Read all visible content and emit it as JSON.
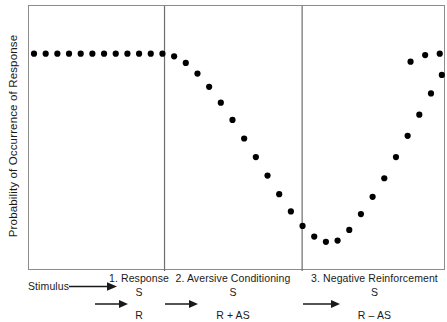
{
  "figure": {
    "y_axis_label": "Probability of Occurrence of Response",
    "stimulus_label": "Stimulus",
    "panels": [
      {
        "title": "1. Response",
        "formula_left": "S",
        "formula_right": "R",
        "arrow_icon": "right-arrow-icon"
      },
      {
        "title": "2. Aversive Conditioning",
        "formula_left": "S",
        "formula_right": "R + AS",
        "arrow_icon": "right-arrow-icon"
      },
      {
        "title": "3. Negative Reinforcement",
        "formula_left": "S",
        "formula_right": "R – AS",
        "arrow_icon": "right-arrow-icon"
      }
    ],
    "colors": {
      "marker": "#000000",
      "frame": "#8c8c8c",
      "divider": "#6e6e6e",
      "text": "#1a1a1a",
      "background": "#ffffff"
    }
  },
  "chart_data": {
    "type": "scatter",
    "title": "",
    "xlabel": "",
    "ylabel": "Probability of Occurrence of Response",
    "grid": false,
    "legend": "none",
    "axis_ticks": false,
    "xlim": [
      0,
      100
    ],
    "ylim": [
      0,
      100
    ],
    "phase_boundaries": [
      32.5,
      65.5
    ],
    "phase_labels": [
      "1. Response",
      "2. Aversive Conditioning",
      "3. Negative Reinforcement"
    ],
    "series": [
      {
        "name": "Probability of response",
        "marker": "filled-circle",
        "x": [
          1.2,
          4.0,
          6.8,
          9.6,
          12.4,
          15.2,
          18.0,
          20.8,
          23.6,
          26.4,
          29.2,
          32.0,
          34.8,
          37.6,
          40.4,
          43.2,
          46.0,
          48.8,
          51.6,
          54.4,
          57.2,
          60.0,
          62.8,
          65.6,
          68.4,
          71.2,
          74.0,
          76.8,
          79.6,
          82.4,
          85.2,
          88.0,
          90.8,
          93.6,
          96.4,
          99.0
        ],
        "y": [
          82.0,
          82.0,
          82.0,
          82.0,
          82.0,
          82.0,
          82.0,
          82.0,
          82.0,
          82.0,
          82.0,
          82.0,
          81.0,
          78.5,
          74.5,
          69.5,
          63.5,
          57.0,
          50.0,
          43.0,
          36.0,
          29.0,
          22.5,
          17.0,
          13.0,
          11.0,
          11.5,
          15.5,
          21.5,
          28.0,
          35.0,
          43.0,
          51.0,
          59.0,
          67.0,
          74.0
        ]
      },
      {
        "name": "Probability of response (upper plateau tail)",
        "marker": "filled-circle",
        "x": [
          91.5,
          95.0,
          98.5
        ],
        "y": [
          79.0,
          81.5,
          82.0
        ]
      }
    ]
  }
}
